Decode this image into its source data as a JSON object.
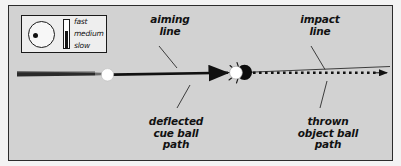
{
  "figure": {
    "background_color": "#d2d2d2",
    "border_color": "#2c2c2c"
  },
  "legend": {
    "ball_icon": "cue-ball-with-contact-point",
    "meter_icon": "speed-meter",
    "scale": [
      {
        "label": "fast"
      },
      {
        "label": "medium"
      },
      {
        "label": "slow"
      }
    ]
  },
  "labels": {
    "aiming_line": "aiming\nline",
    "impact_line": "impact\nline",
    "deflected_cue_ball_path": "deflected\ncue ball\npath",
    "thrown_object_ball_path": "thrown\nobject ball\npath"
  },
  "elements": {
    "cue_stick": "cue-stick",
    "cue_ball": "cue-ball",
    "object_ball": "object-ball",
    "aiming_line": "aiming-line-arrow",
    "impact_line": "impact-line-dotted-arrow",
    "deflected_path": "deflected-cue-ball-path-line",
    "contact_burst": "contact-burst"
  },
  "colors": {
    "plate": "#d2d2d2",
    "ink": "#1a1a1a",
    "cue_ball": "#ffffff",
    "object_ball": "#0d0d0d",
    "legend_bg": "#eeeeee"
  }
}
